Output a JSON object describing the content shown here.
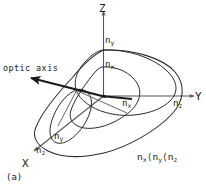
{
  "figure": {
    "caption": "(a)",
    "optic_axis_label": "optic axis",
    "inequality": {
      "n1": "n",
      "n1_sub": "x",
      "op1": "⟨",
      "n2": "n",
      "n2_sub": "y",
      "op2": "⟨",
      "n3": "n",
      "n3_sub": "z"
    },
    "axes": [
      {
        "name": "z-axis",
        "label": "Z"
      },
      {
        "name": "y-axis",
        "label": "Y"
      },
      {
        "name": "x-axis",
        "label": "X"
      }
    ],
    "index_labels": [
      {
        "name": "n-y-on-z-axis",
        "base": "n",
        "sub": "y"
      },
      {
        "name": "n-x-on-inner-ellipse",
        "base": "n",
        "sub": "x"
      },
      {
        "name": "n-x-on-y-axis",
        "base": "n",
        "sub": "x"
      },
      {
        "name": "n-z-on-y-axis",
        "base": "n",
        "sub": "z"
      },
      {
        "name": "n-y-lower-inner",
        "base": "n",
        "sub": "y"
      },
      {
        "name": "n-z-on-x-axis",
        "base": "n",
        "sub": "z"
      }
    ],
    "colors": {
      "ink": "#1a1a1a",
      "curve": "#2b2b2b",
      "axis": "#555555",
      "background": "#ffffff"
    }
  }
}
